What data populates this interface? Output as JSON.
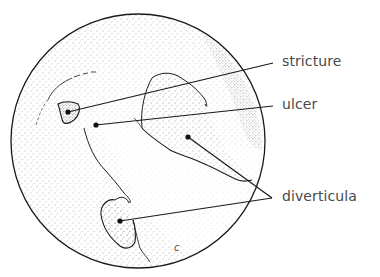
{
  "diagram": {
    "labels": {
      "stricture": "stricture",
      "ulcer": "ulcer",
      "diverticula": "diverticula",
      "corner_mark": "c"
    },
    "colors": {
      "line": "#1a1a1a",
      "text": "#4a4a4a",
      "stipple": "#8a8a8a",
      "background": "#ffffff"
    },
    "annotations": [
      {
        "label": "stricture",
        "points": [
          [
            68,
            112
          ]
        ],
        "anchor": [
          273,
          63
        ]
      },
      {
        "label": "ulcer",
        "points": [
          [
            96,
            125
          ]
        ],
        "anchor": [
          273,
          106
        ]
      },
      {
        "label": "diverticula",
        "points": [
          [
            188,
            137
          ],
          [
            120,
            221
          ]
        ],
        "anchor": [
          272,
          198
        ]
      }
    ]
  }
}
